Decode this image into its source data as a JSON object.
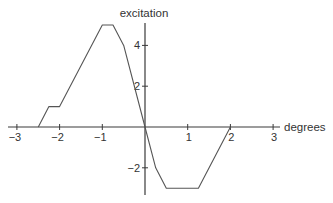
{
  "chart_data": {
    "type": "line",
    "title": "",
    "xlabel": "degrees",
    "ylabel": "excitation",
    "xlim": [
      -3.3,
      3.3
    ],
    "ylim": [
      -3.3,
      5.0
    ],
    "grid": false,
    "x_ticks": [
      -3,
      -2,
      -1,
      1,
      2,
      3
    ],
    "x_tick_labels": [
      "−3",
      "−2",
      "−1",
      "1",
      "2",
      "3"
    ],
    "y_ticks": [
      -2,
      2,
      4
    ],
    "y_tick_labels": [
      "−2",
      "2",
      "4"
    ],
    "series": [
      {
        "name": "excitation",
        "x": [
          -2.5,
          -2.25,
          -2.0,
          -1.0,
          -0.75,
          -0.5,
          0.0,
          0.25,
          0.5,
          1.25,
          2.0
        ],
        "y": [
          0,
          1,
          1,
          5,
          5,
          4,
          0,
          -2,
          -3,
          -3,
          0
        ]
      }
    ]
  }
}
